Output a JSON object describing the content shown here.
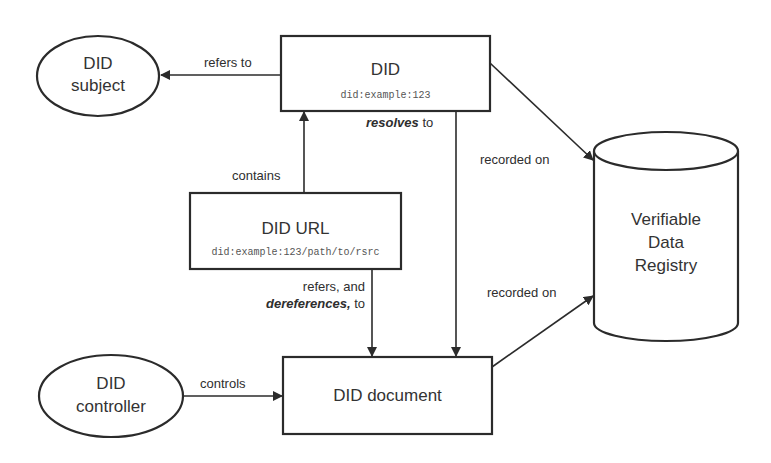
{
  "diagram": {
    "nodes": {
      "did_subject": {
        "line1": "DID",
        "line2": "subject",
        "shape": "ellipse"
      },
      "did": {
        "title": "DID",
        "example": "did:example:123",
        "shape": "box"
      },
      "did_url": {
        "title": "DID URL",
        "example": "did:example:123/path/to/rsrc",
        "shape": "box"
      },
      "did_document": {
        "title": "DID document",
        "shape": "box"
      },
      "did_controller": {
        "line1": "DID",
        "line2": "controller",
        "shape": "ellipse"
      },
      "registry": {
        "line1": "Verifiable",
        "line2": "Data",
        "line3": "Registry",
        "shape": "cylinder"
      }
    },
    "edges": {
      "refers_to": {
        "label": "refers to",
        "from": "DID",
        "to": "DID subject"
      },
      "resolves_to": {
        "label_bold": "resolves",
        "label_rest": " to",
        "from": "DID",
        "to": "DID document"
      },
      "contains": {
        "label": "contains",
        "from": "DID URL",
        "to": "DID"
      },
      "dereferences": {
        "label_line1": "refers, and",
        "label_bold": "dereferences,",
        "label_rest": " to",
        "from": "DID URL",
        "to": "DID document"
      },
      "recorded_on_did": {
        "label": "recorded on",
        "from": "DID",
        "to": "Verifiable Data Registry"
      },
      "recorded_on_doc": {
        "label": "recorded on",
        "from": "DID document",
        "to": "Verifiable Data Registry"
      },
      "controls": {
        "label": "controls",
        "from": "DID controller",
        "to": "DID document"
      }
    },
    "colors": {
      "stroke": "#2b2b2b",
      "background": "#ffffff"
    }
  }
}
